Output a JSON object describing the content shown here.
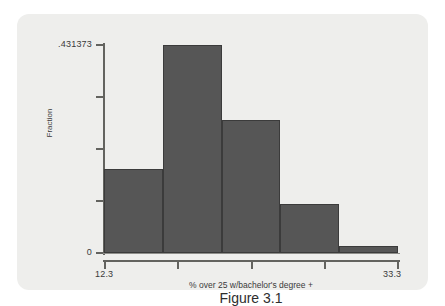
{
  "chart_data": {
    "type": "bar",
    "title": "",
    "subtitle": "",
    "caption": "Figure 3.1",
    "xlabel": "% over 25 w/bachelor's degree +",
    "ylabel": "Fraction",
    "xlim": [
      12.3,
      33.3
    ],
    "ylim": [
      0,
      0.431373
    ],
    "grid": false,
    "legend": null,
    "bin_width": 4.2,
    "bin_edges": [
      12.3,
      16.5,
      20.7,
      24.9,
      29.1,
      33.3
    ],
    "categories": [
      "12.3-16.5",
      "16.5-20.7",
      "20.7-24.9",
      "24.9-29.1",
      "29.1-33.3"
    ],
    "values": [
      0.174,
      0.431373,
      0.276,
      0.102,
      0.015
    ],
    "x_tick_labels": [
      "12.3",
      "33.3"
    ],
    "x_tick_values": [
      12.3,
      33.3
    ],
    "x_tick_positions_frac": [
      0,
      0.25,
      0.5,
      0.75,
      1
    ],
    "y_tick_labels": [
      ".431373",
      "0"
    ],
    "y_tick_values": [
      0.431373,
      0
    ],
    "y_tick_positions_frac": [
      1,
      0.75,
      0.5,
      0.25,
      0
    ],
    "colors": {
      "bar_fill": "#565656",
      "bar_edge": "#3b3b3b",
      "plot_background": "#eeeeec",
      "axis": "#63635f",
      "text": "#3a3a3a",
      "page_background": "#ffffff"
    }
  }
}
